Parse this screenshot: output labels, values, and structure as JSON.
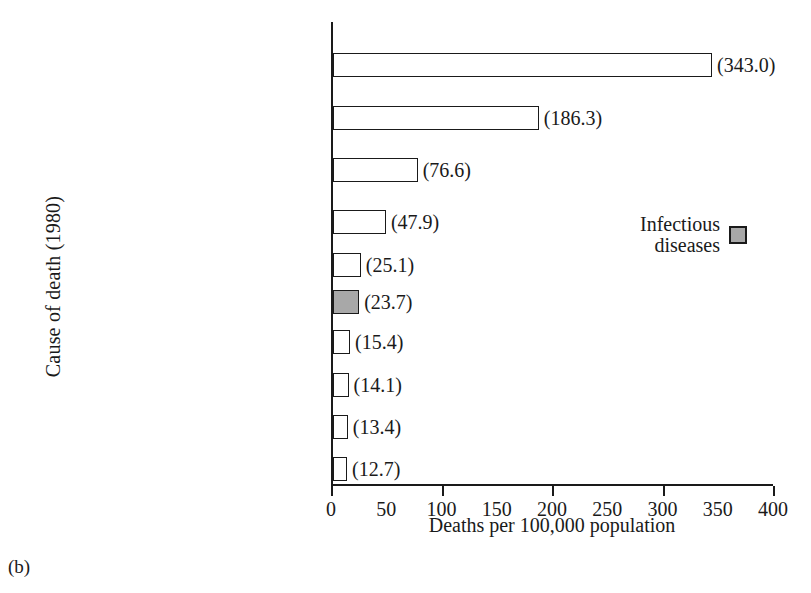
{
  "caption": "(b)",
  "chart_data": {
    "type": "bar",
    "orientation": "horizontal",
    "title": "",
    "xlabel": "Deaths per 100,000 population",
    "ylabel": "Cause of death (1980)",
    "xlim": [
      0,
      400
    ],
    "xticks": [
      0,
      50,
      100,
      150,
      200,
      250,
      300,
      350,
      400
    ],
    "xticklabels": [
      "0",
      "50",
      "100",
      "150",
      "200",
      "250",
      "300",
      "350",
      "400"
    ],
    "major_ticks": [
      0,
      100,
      200,
      300,
      400
    ],
    "grid": false,
    "categories": [
      "Diseases of the heart",
      "Malignant neoplasms",
      "Cerebrovascular diseases",
      "All accidents",
      "Chronic obstructive\npulmonary diseases",
      "Pneumonia (all forms)\nand influenza",
      "Diabetes mellitus",
      "Cirrhosis of the liver",
      "Atherosclerosis",
      "Suicide"
    ],
    "values": [
      343.0,
      186.3,
      76.6,
      47.9,
      25.1,
      23.7,
      15.4,
      14.1,
      13.4,
      12.7
    ],
    "value_labels": [
      "(343.0)",
      "(186.3)",
      "(76.6)",
      "(47.9)",
      "(25.1)",
      "(23.7)",
      "(15.4)",
      "(14.1)",
      "(13.4)",
      "(12.7)"
    ],
    "bar_fills": [
      "white",
      "white",
      "white",
      "white",
      "white",
      "shaded",
      "white",
      "white",
      "white",
      "white"
    ],
    "colors": {
      "bar_face": "#ffffff",
      "bar_shaded_face": "#a8a8a8",
      "bar_edge": "#1a1a1a",
      "axis": "#1a1a1a",
      "text": "#1a1a1a",
      "background": "#ffffff"
    },
    "legend": {
      "position": "upper-right-inside",
      "entries": [
        {
          "label": "Infectious\ndiseases",
          "fill": "#a8a8a8"
        }
      ]
    }
  }
}
